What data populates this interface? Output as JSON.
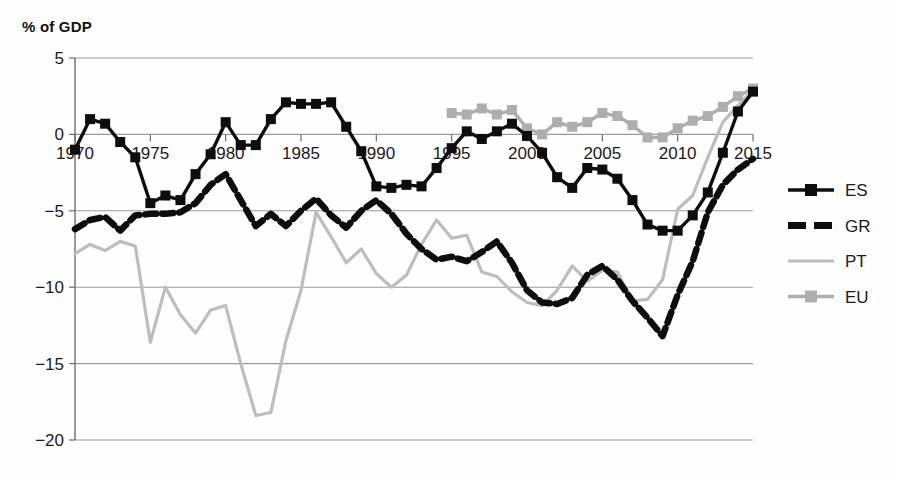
{
  "chart_data": {
    "type": "line",
    "title": "",
    "ylabel": "% of GDP",
    "xlabel": "",
    "ylim": [
      -20,
      5
    ],
    "xlim": [
      1970,
      2015
    ],
    "yticks": [
      5,
      0,
      -5,
      -10,
      -15,
      -20
    ],
    "ytick_labels": [
      "5",
      "0",
      "-5",
      "-10",
      "-15",
      "-20"
    ],
    "xticks": [
      1970,
      1975,
      1980,
      1985,
      1990,
      1995,
      2000,
      2005,
      2010,
      2015
    ],
    "xtick_labels": [
      "1970",
      "1975",
      "1980",
      "1985",
      "1990",
      "1995",
      "2000",
      "2005",
      "2010",
      "2015"
    ],
    "grid": true,
    "legend_position": "right",
    "series": [
      {
        "name": "ES",
        "color": "#0d0d0d",
        "style": "solid-marker",
        "marker": "square",
        "x": [
          1970,
          1971,
          1972,
          1973,
          1974,
          1975,
          1976,
          1977,
          1978,
          1979,
          1980,
          1981,
          1982,
          1983,
          1984,
          1985,
          1986,
          1987,
          1988,
          1989,
          1990,
          1991,
          1992,
          1993,
          1994,
          1995,
          1996,
          1997,
          1998,
          1999,
          2000,
          2001,
          2002,
          2003,
          2004,
          2005,
          2006,
          2007,
          2008,
          2009,
          2010,
          2011,
          2012,
          2013,
          2014,
          2015
        ],
        "values": [
          -1.0,
          1.0,
          0.7,
          -0.5,
          -1.5,
          -4.5,
          -4.0,
          -4.3,
          -2.6,
          -1.3,
          0.8,
          -0.7,
          -0.7,
          1.0,
          2.1,
          2.0,
          2.0,
          2.1,
          0.5,
          -1.1,
          -3.4,
          -3.5,
          -3.3,
          -3.4,
          -2.2,
          -0.9,
          0.2,
          -0.3,
          0.2,
          0.7,
          -0.1,
          -1.2,
          -2.8,
          -3.5,
          -2.2,
          -2.3,
          -2.9,
          -4.3,
          -5.9,
          -6.3,
          -6.3,
          -5.3,
          -3.8,
          -1.2,
          1.5,
          2.8
        ]
      },
      {
        "name": "GR",
        "color": "#0d0d0d",
        "style": "dashed",
        "marker": "none",
        "x": [
          1970,
          1971,
          1972,
          1973,
          1974,
          1975,
          1976,
          1977,
          1978,
          1979,
          1980,
          1981,
          1982,
          1983,
          1984,
          1985,
          1986,
          1987,
          1988,
          1989,
          1990,
          1991,
          1992,
          1993,
          1994,
          1995,
          1996,
          1997,
          1998,
          1999,
          2000,
          2001,
          2002,
          2003,
          2004,
          2005,
          2006,
          2007,
          2008,
          2009,
          2010,
          2011,
          2012,
          2013,
          2014,
          2015
        ],
        "values": [
          -6.2,
          -5.6,
          -5.4,
          -6.3,
          -5.3,
          -5.2,
          -5.2,
          -5.1,
          -4.5,
          -3.3,
          -2.6,
          -4.3,
          -6.0,
          -5.2,
          -6.0,
          -5.0,
          -4.2,
          -5.3,
          -6.1,
          -5.0,
          -4.3,
          -5.2,
          -6.5,
          -7.5,
          -8.2,
          -8.0,
          -8.3,
          -7.7,
          -7.0,
          -8.4,
          -10.2,
          -11.0,
          -11.1,
          -10.7,
          -9.2,
          -8.6,
          -9.5,
          -10.9,
          -12.0,
          -13.2,
          -10.5,
          -8.3,
          -5.1,
          -3.3,
          -2.3,
          -1.6
        ]
      },
      {
        "name": "PT",
        "color": "#bdbdbd",
        "style": "thin",
        "marker": "none",
        "x": [
          1970,
          1971,
          1972,
          1973,
          1974,
          1975,
          1976,
          1977,
          1978,
          1979,
          1980,
          1981,
          1982,
          1983,
          1984,
          1985,
          1986,
          1987,
          1988,
          1989,
          1990,
          1991,
          1992,
          1993,
          1994,
          1995,
          1996,
          1997,
          1998,
          1999,
          2000,
          2001,
          2002,
          2003,
          2004,
          2005,
          2006,
          2007,
          2008,
          2009,
          2010,
          2011,
          2012,
          2013,
          2014,
          2015
        ],
        "values": [
          -7.8,
          -7.2,
          -7.6,
          -7.0,
          -7.3,
          -13.6,
          -10.0,
          -11.8,
          -13.0,
          -11.5,
          -11.2,
          -15.0,
          -18.4,
          -18.2,
          -13.5,
          -10.2,
          -5.1,
          -6.7,
          -8.4,
          -7.5,
          -9.1,
          -10.0,
          -9.2,
          -7.2,
          -5.6,
          -6.8,
          -6.6,
          -9.0,
          -9.3,
          -10.3,
          -11.0,
          -11.2,
          -10.2,
          -8.6,
          -9.6,
          -8.9,
          -9.0,
          -10.9,
          -10.8,
          -9.5,
          -4.9,
          -4.0,
          -1.5,
          0.8,
          1.9,
          2.9
        ]
      },
      {
        "name": "EU",
        "color": "#aeaeae",
        "style": "solid-marker",
        "marker": "square",
        "x": [
          1995,
          1996,
          1997,
          1998,
          1999,
          2000,
          2001,
          2002,
          2003,
          2004,
          2005,
          2006,
          2007,
          2008,
          2009,
          2010,
          2011,
          2012,
          2013,
          2014,
          2015
        ],
        "values": [
          1.4,
          1.3,
          1.7,
          1.3,
          1.6,
          0.4,
          0.0,
          0.8,
          0.5,
          0.8,
          1.4,
          1.2,
          0.6,
          -0.2,
          -0.2,
          0.4,
          0.9,
          1.2,
          1.8,
          2.5,
          3.0
        ]
      }
    ],
    "legend": [
      {
        "label": "ES",
        "color": "#0d0d0d",
        "style": "solid-marker"
      },
      {
        "label": "GR",
        "color": "#0d0d0d",
        "style": "dashed"
      },
      {
        "label": "PT",
        "color": "#bdbdbd",
        "style": "thin"
      },
      {
        "label": "EU",
        "color": "#aeaeae",
        "style": "solid-marker"
      }
    ]
  }
}
